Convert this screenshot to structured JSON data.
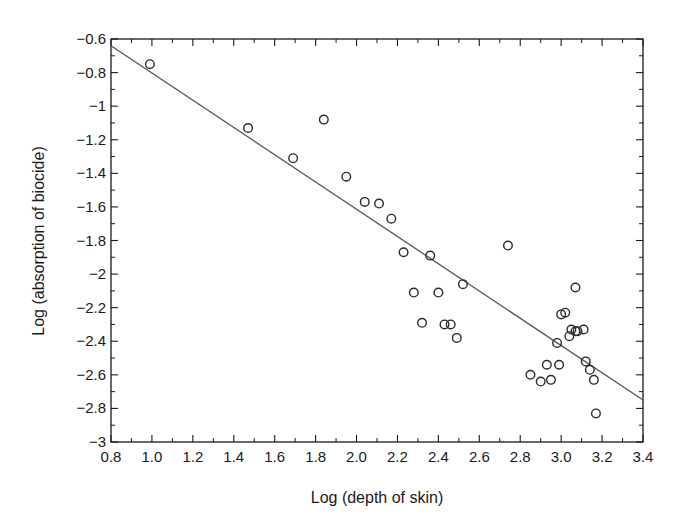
{
  "chart_data": {
    "type": "scatter",
    "title": "",
    "xlabel": "Log (depth of skin)",
    "ylabel": "Log (absorption of biocide)",
    "xlim": [
      0.8,
      3.4
    ],
    "ylim": [
      -3,
      -0.6
    ],
    "x_ticks": [
      "0.8",
      "1.0",
      "1.2",
      "1.4",
      "1.6",
      "1.8",
      "2.0",
      "2.2",
      "2.4",
      "2.6",
      "2.8",
      "3.0",
      "3.2",
      "3.4"
    ],
    "y_ticks": [
      "-0.6",
      "-0.8",
      "-1",
      "-1.2",
      "-1.4",
      "-1.6",
      "-1.8",
      "-2",
      "-2.2",
      "-2.4",
      "-2.6",
      "-2.8",
      "-3"
    ],
    "grid": false,
    "legend": null,
    "marker": "open-circle",
    "series": [
      {
        "name": "observations",
        "points": [
          [
            0.99,
            -0.75
          ],
          [
            1.47,
            -1.13
          ],
          [
            1.69,
            -1.31
          ],
          [
            1.84,
            -1.08
          ],
          [
            1.95,
            -1.42
          ],
          [
            2.04,
            -1.57
          ],
          [
            2.11,
            -1.58
          ],
          [
            2.17,
            -1.67
          ],
          [
            2.23,
            -1.87
          ],
          [
            2.36,
            -1.89
          ],
          [
            2.74,
            -1.83
          ],
          [
            2.28,
            -2.11
          ],
          [
            2.4,
            -2.11
          ],
          [
            2.52,
            -2.06
          ],
          [
            2.32,
            -2.29
          ],
          [
            2.43,
            -2.3
          ],
          [
            2.46,
            -2.3
          ],
          [
            2.49,
            -2.38
          ],
          [
            3.07,
            -2.08
          ],
          [
            3.0,
            -2.24
          ],
          [
            3.02,
            -2.23
          ],
          [
            3.04,
            -2.37
          ],
          [
            3.05,
            -2.33
          ],
          [
            3.07,
            -2.34
          ],
          [
            3.08,
            -2.34
          ],
          [
            3.11,
            -2.33
          ],
          [
            2.98,
            -2.41
          ],
          [
            2.93,
            -2.54
          ],
          [
            2.99,
            -2.54
          ],
          [
            2.85,
            -2.6
          ],
          [
            2.9,
            -2.64
          ],
          [
            2.95,
            -2.63
          ],
          [
            3.12,
            -2.52
          ],
          [
            3.14,
            -2.57
          ],
          [
            3.16,
            -2.63
          ],
          [
            3.17,
            -2.83
          ]
        ]
      }
    ],
    "fit_line": {
      "name": "regression",
      "from": [
        0.8,
        -0.64
      ],
      "to": [
        3.4,
        -2.75
      ]
    }
  },
  "colors": {
    "axis": "#1a1a1a",
    "marker": "#2a2a2a",
    "fit_line": "#555555",
    "background": "#ffffff"
  }
}
